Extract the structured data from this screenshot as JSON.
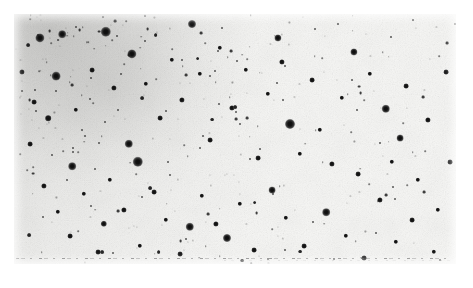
{
  "figure": {
    "kind": "astronomical-plate-negative",
    "background_color": "#ffffff",
    "sky_color": "#f7f7f5",
    "star_color": "#1b1b1b",
    "margins_px": {
      "top": 14,
      "right": 17,
      "bottom": 24,
      "left": 14
    },
    "plate": {
      "x": 14,
      "y": 14,
      "width": 442,
      "height": 250
    },
    "artifact_line": {
      "name": "dashed-edge-artifact",
      "y": 244,
      "style": "dashed",
      "color": "#3c3c3c"
    }
  },
  "chart_data": {
    "type": "scatter",
    "title": "",
    "subtitle": "",
    "xlabel": "",
    "ylabel": "",
    "xlim": [
      0,
      442
    ],
    "ylim": [
      0,
      250
    ],
    "grid": false,
    "legend": null,
    "note": "Star positions given in plate pixel coordinates (origin top-left of plate). 'r' is rendered point radius in px, proxy for apparent brightness; larger r = brighter star. Stellar surface density is highest in the upper-left (cluster concentration) and falls off toward the lower-right field.",
    "density_gradient": {
      "peak_corner": "upper-left",
      "falloff_direction": "lower-right"
    },
    "series": [
      {
        "name": "bright-stars",
        "marker": "halo",
        "points": [
          [
            92,
            18,
            5.2
          ],
          [
            26,
            24,
            4.6
          ],
          [
            48,
            20,
            3.8
          ],
          [
            276,
            110,
            5.0
          ],
          [
            124,
            148,
            5.2
          ],
          [
            42,
            62,
            4.4
          ],
          [
            118,
            40,
            4.6
          ],
          [
            372,
            95,
            4.2
          ],
          [
            58,
            152,
            3.8
          ],
          [
            115,
            130,
            4.2
          ],
          [
            213,
            224,
            4.0
          ],
          [
            176,
            213,
            4.2
          ],
          [
            312,
            198,
            3.8
          ],
          [
            178,
            10,
            4.0
          ],
          [
            264,
            24,
            3.6
          ],
          [
            340,
            38,
            3.6
          ],
          [
            258,
            176,
            3.4
          ],
          [
            386,
            124,
            3.4
          ],
          [
            90,
            210,
            3.2
          ]
        ]
      },
      {
        "name": "medium-stars",
        "marker": "big",
        "points": [
          [
            8,
            58,
            2.6
          ],
          [
            20,
            88,
            2.4
          ],
          [
            34,
            104,
            2.8
          ],
          [
            62,
            96,
            2.2
          ],
          [
            78,
            56,
            2.4
          ],
          [
            100,
            74,
            2.6
          ],
          [
            132,
            70,
            2.2
          ],
          [
            146,
            104,
            2.4
          ],
          [
            158,
            46,
            2.2
          ],
          [
            168,
            86,
            2.6
          ],
          [
            186,
            60,
            2.2
          ],
          [
            196,
            126,
            2.4
          ],
          [
            206,
            34,
            2.2
          ],
          [
            218,
            94,
            2.6
          ],
          [
            232,
            56,
            2.2
          ],
          [
            244,
            144,
            2.4
          ],
          [
            254,
            80,
            2.2
          ],
          [
            268,
            48,
            2.6
          ],
          [
            286,
            140,
            2.2
          ],
          [
            298,
            66,
            2.4
          ],
          [
            306,
            116,
            2.2
          ],
          [
            318,
            150,
            2.6
          ],
          [
            328,
            84,
            2.2
          ],
          [
            344,
            160,
            2.4
          ],
          [
            356,
            60,
            2.2
          ],
          [
            366,
            186,
            2.6
          ],
          [
            378,
            148,
            2.2
          ],
          [
            392,
            72,
            2.4
          ],
          [
            404,
            166,
            2.2
          ],
          [
            414,
            106,
            2.6
          ],
          [
            424,
            196,
            2.2
          ],
          [
            432,
            58,
            2.4
          ],
          [
            16,
            130,
            2.4
          ],
          [
            30,
            172,
            2.6
          ],
          [
            44,
            198,
            2.2
          ],
          [
            56,
            222,
            2.4
          ],
          [
            70,
            180,
            2.2
          ],
          [
            84,
            238,
            2.4
          ],
          [
            96,
            166,
            2.2
          ],
          [
            110,
            196,
            2.6
          ],
          [
            126,
            232,
            2.2
          ],
          [
            140,
            178,
            2.4
          ],
          [
            152,
            206,
            2.2
          ],
          [
            166,
            240,
            2.4
          ],
          [
            188,
            182,
            2.2
          ],
          [
            202,
            210,
            2.6
          ],
          [
            226,
            190,
            2.2
          ],
          [
            240,
            236,
            2.4
          ],
          [
            272,
            204,
            2.2
          ],
          [
            290,
            232,
            2.4
          ],
          [
            332,
            222,
            2.2
          ],
          [
            350,
            244,
            2.4
          ],
          [
            382,
            228,
            2.2
          ],
          [
            398,
            206,
            2.4
          ],
          [
            420,
            238,
            2.2
          ],
          [
            436,
            148,
            2.4
          ]
        ]
      },
      {
        "name": "faint-field-stars",
        "marker": "dot",
        "count_estimate": 900
      }
    ]
  }
}
